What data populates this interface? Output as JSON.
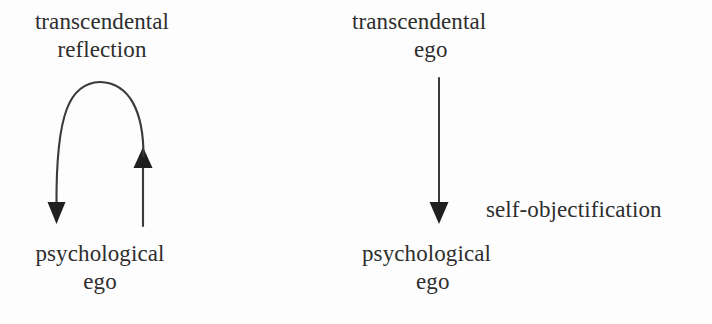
{
  "figure": {
    "background_color": "#fdfdfd",
    "ink_color": "#2e2e2e",
    "stroke_color": "#3a3a3a"
  },
  "left_diagram": {
    "top_label_line1": "transcendental",
    "top_label_line2": "reflection",
    "bottom_label_line1": "psychological",
    "bottom_label_line2": "ego",
    "arc_description": "curved double-headed arc looping from transcendental reflection down to psychological ego and back up"
  },
  "right_diagram": {
    "top_label_line1": "transcendental",
    "top_label_line2": "ego",
    "bottom_label_line1": "psychological",
    "bottom_label_line2": "ego",
    "edge_label": "self-objectification",
    "arrow_description": "straight downward arrow from transcendental ego to psychological ego"
  }
}
